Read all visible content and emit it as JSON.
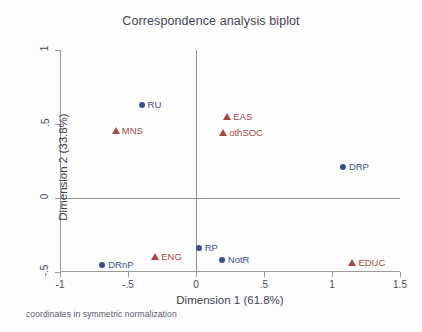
{
  "chart_data": {
    "type": "scatter",
    "title": "Correspondence analysis biplot",
    "xlabel": "Dimension 1 (61.8%)",
    "ylabel": "Dimension 2 (33.8%)",
    "footnote": "coordinates in symmetric normalization",
    "xlim": [
      -1,
      1.5
    ],
    "ylim": [
      -0.5,
      1
    ],
    "xticks": [
      "-1",
      "-.5",
      "0",
      ".5",
      "1",
      "1.5"
    ],
    "xtick_values": [
      -1,
      -0.5,
      0,
      0.5,
      1,
      1.5
    ],
    "yticks": [
      "1",
      ".5",
      "0",
      "-.5"
    ],
    "ytick_values": [
      1,
      0.5,
      0,
      -0.5
    ],
    "grid": false,
    "legend": "none",
    "zero_lines": true,
    "colors": {
      "row_points": "#3b4f8f",
      "col_points": "#a04a4a",
      "axis": "#9a9a9a",
      "zero_line": "#8e8e9c",
      "text": "#3f3f52"
    },
    "series": [
      {
        "name": "row coordinates",
        "marker": "circle",
        "color": "#3b4f8f",
        "points": [
          {
            "label": "RU",
            "x": -0.4,
            "y": 0.63
          },
          {
            "label": "DRP",
            "x": 1.08,
            "y": 0.21
          },
          {
            "label": "RP",
            "x": 0.02,
            "y": -0.34
          },
          {
            "label": "NotR",
            "x": 0.19,
            "y": -0.42
          },
          {
            "label": "DRnP",
            "x": -0.69,
            "y": -0.45
          }
        ]
      },
      {
        "name": "column coordinates",
        "marker": "triangle",
        "color": "#a04a4a",
        "points": [
          {
            "label": "EAS",
            "x": 0.23,
            "y": 0.55
          },
          {
            "label": "othSOC",
            "x": 0.2,
            "y": 0.44
          },
          {
            "label": "MNS",
            "x": -0.59,
            "y": 0.45
          },
          {
            "label": "ENG",
            "x": -0.3,
            "y": -0.4
          },
          {
            "label": "EDUC",
            "x": 1.15,
            "y": -0.44
          }
        ]
      }
    ]
  }
}
